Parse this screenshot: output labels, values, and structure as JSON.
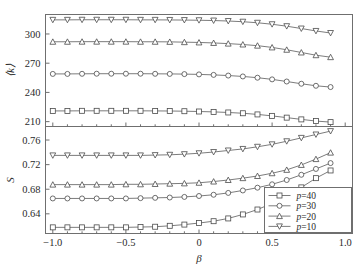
{
  "figure": {
    "background": "#ffffff",
    "line_color": "#5b5b5b",
    "frame_color": "#6f6f6f"
  },
  "chart_data": [
    {
      "type": "line",
      "panel": "top",
      "title": "",
      "xlabel": "",
      "ylabel": "⟨k⟩",
      "xlim": [
        -1.05,
        1.05
      ],
      "ylim": [
        205,
        320
      ],
      "xticks": [
        -1.0,
        -0.5,
        0.0,
        0.5,
        1.0
      ],
      "xticklabels": [
        "",
        "",
        "",
        "",
        ""
      ],
      "yticks": [
        210,
        240,
        270,
        300
      ],
      "yticklabels": [
        "210",
        "240",
        "270",
        "300"
      ],
      "grid": false,
      "x": [
        -1.0,
        -0.9,
        -0.8,
        -0.7,
        -0.6,
        -0.5,
        -0.4,
        -0.3,
        -0.2,
        -0.1,
        0.0,
        0.1,
        0.2,
        0.3,
        0.4,
        0.5,
        0.6,
        0.7,
        0.8,
        0.9
      ],
      "series": [
        {
          "name": "p=10",
          "marker": "triangle-down",
          "values": [
            314.5,
            314.5,
            314.6,
            314.6,
            314.6,
            314.6,
            314.5,
            314.5,
            314.4,
            314.3,
            314.1,
            313.8,
            313.3,
            312.6,
            311.5,
            310.0,
            308.0,
            305.6,
            303.1,
            301.0
          ]
        },
        {
          "name": "p=20",
          "marker": "triangle-up",
          "values": [
            292.0,
            292.0,
            292.1,
            292.1,
            292.1,
            292.1,
            292.0,
            292.0,
            291.9,
            291.6,
            291.3,
            290.8,
            290.1,
            289.2,
            288.0,
            286.2,
            283.8,
            281.0,
            278.2,
            276.2
          ]
        },
        {
          "name": "p=30",
          "marker": "circle",
          "values": [
            259.0,
            259.0,
            259.1,
            259.2,
            259.2,
            259.2,
            259.2,
            259.1,
            259.0,
            258.8,
            258.5,
            258.0,
            257.3,
            256.4,
            255.1,
            253.4,
            251.2,
            248.9,
            246.8,
            245.5
          ]
        },
        {
          "name": "p=40",
          "marker": "square",
          "values": [
            221.0,
            221.0,
            221.1,
            221.1,
            221.1,
            221.1,
            221.1,
            221.0,
            220.9,
            220.7,
            220.4,
            220.0,
            219.4,
            218.6,
            217.4,
            215.9,
            214.1,
            212.3,
            210.6,
            209.5
          ]
        }
      ]
    },
    {
      "type": "line",
      "panel": "bottom",
      "title": "",
      "xlabel": "β",
      "ylabel": "S",
      "xlim": [
        -1.05,
        1.05
      ],
      "ylim": [
        0.608,
        0.782
      ],
      "xticks": [
        -1.0,
        -0.5,
        0.0,
        0.5,
        1.0
      ],
      "xticklabels": [
        "−1.0",
        "−0.5",
        "0",
        "0.5",
        "1.0"
      ],
      "yticks": [
        0.64,
        0.68,
        0.72,
        0.76
      ],
      "yticklabels": [
        "0.64",
        "0.68",
        "0.72",
        "0.76"
      ],
      "grid": false,
      "x": [
        -1.0,
        -0.9,
        -0.8,
        -0.7,
        -0.6,
        -0.5,
        -0.4,
        -0.3,
        -0.2,
        -0.1,
        0.0,
        0.1,
        0.2,
        0.3,
        0.4,
        0.5,
        0.6,
        0.7,
        0.8,
        0.9
      ],
      "series": [
        {
          "name": "p=10",
          "marker": "triangle-down",
          "values": [
            0.735,
            0.735,
            0.735,
            0.735,
            0.735,
            0.735,
            0.735,
            0.7355,
            0.736,
            0.737,
            0.7385,
            0.7405,
            0.743,
            0.7455,
            0.749,
            0.753,
            0.758,
            0.7635,
            0.769,
            0.7745
          ]
        },
        {
          "name": "p=20",
          "marker": "triangle-up",
          "values": [
            0.6875,
            0.6875,
            0.6875,
            0.6875,
            0.6875,
            0.688,
            0.688,
            0.6885,
            0.689,
            0.6895,
            0.6905,
            0.6925,
            0.695,
            0.698,
            0.7015,
            0.706,
            0.7115,
            0.7195,
            0.729,
            0.7395
          ]
        },
        {
          "name": "p=30",
          "marker": "circle",
          "values": [
            0.665,
            0.665,
            0.665,
            0.665,
            0.665,
            0.665,
            0.6655,
            0.666,
            0.6665,
            0.6675,
            0.669,
            0.671,
            0.674,
            0.678,
            0.6825,
            0.688,
            0.695,
            0.7035,
            0.713,
            0.7225
          ]
        },
        {
          "name": "p=40",
          "marker": "square",
          "values": [
            0.618,
            0.618,
            0.618,
            0.618,
            0.618,
            0.618,
            0.6185,
            0.619,
            0.6205,
            0.6225,
            0.625,
            0.628,
            0.6325,
            0.639,
            0.647,
            0.657,
            0.669,
            0.683,
            0.698,
            0.7105
          ]
        }
      ],
      "legend": {
        "position": "lower-right",
        "entries": [
          {
            "label": "p=40",
            "marker": "square"
          },
          {
            "label": "p=30",
            "marker": "circle"
          },
          {
            "label": "p=20",
            "marker": "triangle-up"
          },
          {
            "label": "p=10",
            "marker": "triangle-down"
          }
        ]
      }
    }
  ]
}
